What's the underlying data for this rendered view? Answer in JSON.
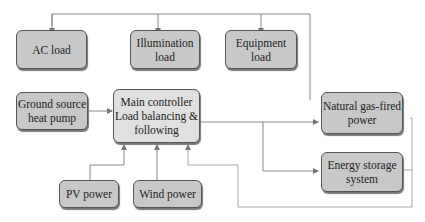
{
  "diagram": {
    "nodes": {
      "ac_load": "AC load",
      "illumination_load": "Illumination load",
      "equipment_load": "Equipment load",
      "ground_source": "Ground source heat pump",
      "main_controller": "Main controller Load balancing & following",
      "natural_gas": "Natural gas-fired power",
      "energy_storage": "Energy storage system",
      "pv_power": "PV power",
      "wind_power": "Wind power"
    },
    "edges": [
      {
        "from": "main_controller",
        "to": "ac_load"
      },
      {
        "from": "main_controller",
        "to": "illumination_load"
      },
      {
        "from": "main_controller",
        "to": "equipment_load"
      },
      {
        "from": "ground_source",
        "to": "main_controller"
      },
      {
        "from": "pv_power",
        "to": "main_controller"
      },
      {
        "from": "wind_power",
        "to": "main_controller"
      },
      {
        "from": "main_controller",
        "to": "natural_gas"
      },
      {
        "from": "main_controller",
        "to": "energy_storage"
      },
      {
        "from": "natural_gas",
        "to": "main_controller"
      },
      {
        "from": "energy_storage",
        "to": "main_controller"
      }
    ],
    "colors": {
      "box_fill": "#c8c8c8",
      "controller_fill": "#e0e0e0",
      "line": "#888888"
    }
  }
}
